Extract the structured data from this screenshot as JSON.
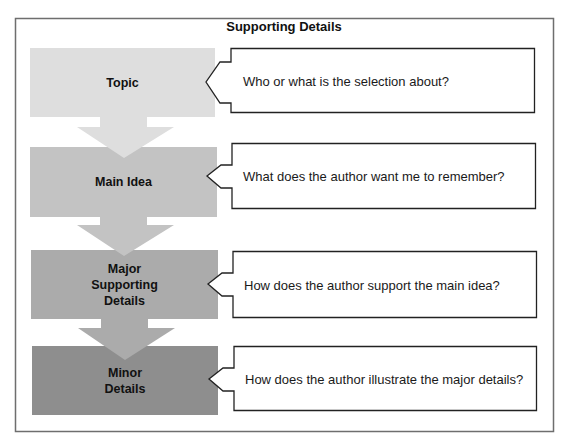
{
  "diagram": {
    "title": "Supporting Details",
    "colors": {
      "frame": "#6e6e6e",
      "callout_border": "#222222",
      "topic": "#dedede",
      "main_idea": "#c3c3c3",
      "major": "#ababab",
      "minor": "#8e8e8e"
    },
    "levels": [
      {
        "label": "Topic",
        "question": "Who or what is the selection about?"
      },
      {
        "label": "Main Idea",
        "question": "What does the author want me to remember?"
      },
      {
        "label": "Major Supporting Details",
        "label_lines": [
          "Major",
          "Supporting",
          "Details"
        ],
        "question": "How does the author support the main idea?"
      },
      {
        "label": "Minor Details",
        "label_lines": [
          "Minor",
          "Details"
        ],
        "question": "How does the author illustrate the major details?"
      }
    ]
  }
}
